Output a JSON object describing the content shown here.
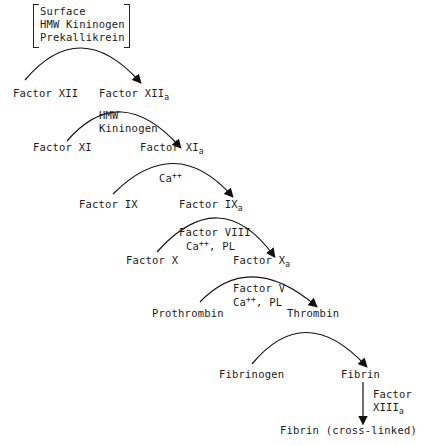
{
  "diagram": {
    "initiators": [
      "Surface",
      "HMW Kininogen",
      "Prekallikrein"
    ],
    "steps": [
      {
        "from": "Factor XII",
        "to": "Factor XII",
        "to_sub": "a",
        "cofactors": []
      },
      {
        "from": "Factor XI",
        "to": "Factor XI",
        "to_sub": "a",
        "cofactors": [
          "HMW",
          "Kininogen"
        ]
      },
      {
        "from": "Factor IX",
        "to": "Factor IX",
        "to_sub": "a",
        "cofactors": [
          "Ca++"
        ]
      },
      {
        "from": "Factor X",
        "to": "Factor X",
        "to_sub": "a",
        "cofactors": [
          "Factor VIII",
          "Ca++, PL"
        ]
      },
      {
        "from": "Prothrombin",
        "to": "Thrombin",
        "to_sub": "",
        "cofactors": [
          "Factor V",
          "Ca++, PL"
        ]
      },
      {
        "from": "Fibrinogen",
        "to": "Fibrin",
        "to_sub": "",
        "cofactors": []
      }
    ],
    "final": {
      "from": "Fibrin",
      "to": "Fibrin (cross-linked)",
      "enzyme": "Factor",
      "enzyme2": "XIII",
      "enzyme2_sub": "a"
    },
    "labels": {
      "surface": "Surface",
      "hmw_kininogen": "HMW Kininogen",
      "prekallikrein": "Prekallikrein",
      "f12": "Factor XII",
      "f12a": "Factor XII",
      "f11": "Factor XI",
      "f11a": "Factor XI",
      "hmw": "HMW",
      "kininogen": "Kininogen",
      "f9": "Factor IX",
      "f9a": "Factor IX",
      "ca": "Ca",
      "plusplus": "++",
      "f10": "Factor X",
      "f10a": "Factor X",
      "f8": "Factor VIII",
      "comma_pl": ", PL",
      "prothrombin": "Prothrombin",
      "thrombin": "Thrombin",
      "f5": "Factor V",
      "fibrinogen": "Fibrinogen",
      "fibrin": "Fibrin",
      "factor": "Factor",
      "xiii": "XIII",
      "sub_a": "a",
      "fibrin_cl": "Fibrin (cross-linked)"
    }
  }
}
